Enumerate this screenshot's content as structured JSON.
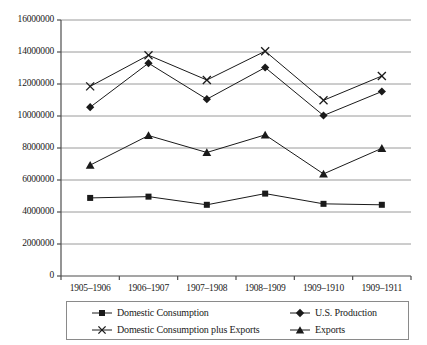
{
  "chart_data": {
    "type": "line",
    "title": "",
    "subtitle": "",
    "xlabel": "",
    "ylabel": "",
    "categories": [
      "1905–1906",
      "1906–1907",
      "1907–1908",
      "1908–1909",
      "1909–1910",
      "1909–1911"
    ],
    "ylim": [
      0,
      16000000
    ],
    "ytick_values": [
      0,
      2000000,
      4000000,
      6000000,
      8000000,
      10000000,
      12000000,
      14000000,
      16000000
    ],
    "ytick_labels": [
      "0",
      "2000000",
      "4000000",
      "6000000",
      "8000000",
      "10000000",
      "12000000",
      "14000000",
      "16000000"
    ],
    "grid": "horizontal",
    "legend_position": "below",
    "series": [
      {
        "name": "Domestic Consumption",
        "marker": "square",
        "color": "#1a1a1a",
        "values": [
          4880000,
          4960000,
          4450000,
          5150000,
          4510000,
          4450000
        ]
      },
      {
        "name": "U.S. Production",
        "marker": "diamond",
        "color": "#1a1a1a",
        "values": [
          10550000,
          13300000,
          11050000,
          13030000,
          10030000,
          11530000
        ]
      },
      {
        "name": "Domestic Consumption plus Exports",
        "marker": "x",
        "color": "#1a1a1a",
        "values": [
          11850000,
          13800000,
          12250000,
          14050000,
          10980000,
          12500000
        ]
      },
      {
        "name": "Exports",
        "marker": "triangle",
        "color": "#1a1a1a",
        "values": [
          6930000,
          8780000,
          7720000,
          8820000,
          6380000,
          7980000
        ]
      }
    ]
  },
  "legend": {
    "entries": [
      {
        "label": "Domestic Consumption",
        "marker": "square"
      },
      {
        "label": "U.S. Production",
        "marker": "diamond"
      },
      {
        "label": "Domestic Consumption plus Exports",
        "marker": "x"
      },
      {
        "label": "Exports",
        "marker": "triangle"
      }
    ]
  },
  "style": {
    "axis_color": "#4d4d4d",
    "grid_color": "#9a9a9a",
    "line_color": "#1a1a1a",
    "text_color": "#1a1a1a",
    "background": "#ffffff",
    "legend_border": "#8a8a8a"
  }
}
